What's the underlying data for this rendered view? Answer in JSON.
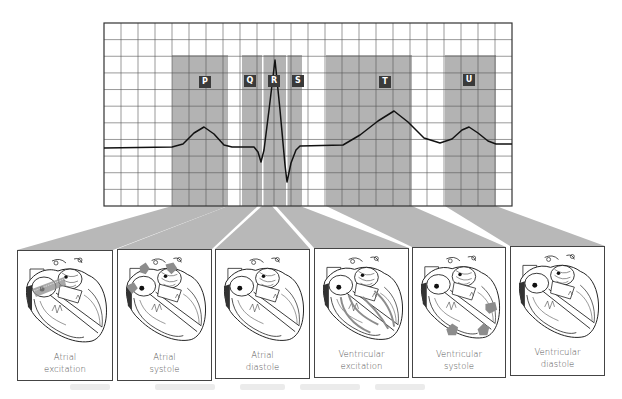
{
  "diagram": {
    "type": "ECG waveform correlated with cardiac cycle phases",
    "colors": {
      "grid_line": "#555555",
      "band_fill": "#b3b3b3",
      "beam_fill": "#b8b8b8",
      "trace": "#111111",
      "label_bg": "#3a3a3a",
      "label_fg": "#ffffff",
      "panel_border": "#444444",
      "highlight": "#8c8c8c"
    },
    "grid": {
      "x": 104,
      "y": 23,
      "width": 408,
      "height": 183,
      "columns": 24,
      "rows": 11
    },
    "waves": [
      {
        "label": "P",
        "band_x": 172,
        "band_w": 56,
        "label_x": 199,
        "label_y": 76
      },
      {
        "label": "Q",
        "band_x": 242,
        "band_w": 20,
        "label_x": 244,
        "label_y": 75
      },
      {
        "label": "R",
        "band_x": 264,
        "band_w": 16,
        "label_x": 268,
        "label_y": 75
      },
      {
        "label": "S",
        "band_x": 282,
        "band_w": 20,
        "label_x": 292,
        "label_y": 75
      },
      {
        "label": "T",
        "band_x": 326,
        "band_w": 86,
        "label_x": 379,
        "label_y": 76
      },
      {
        "label": "U",
        "band_x": 445,
        "band_w": 51,
        "label_x": 463,
        "label_y": 74
      }
    ],
    "panels": [
      {
        "line1": "Atrial",
        "line2": "excitation",
        "x": 17,
        "y": 250,
        "w": 96,
        "h": 131,
        "highlight": "atria-conduction"
      },
      {
        "line1": "Atrial",
        "line2": "systole",
        "x": 117,
        "y": 249,
        "w": 95,
        "h": 132,
        "highlight": "atria-arrows"
      },
      {
        "line1": "Atrial",
        "line2": "diastole",
        "x": 215,
        "y": 249,
        "w": 95,
        "h": 130,
        "highlight": "none"
      },
      {
        "line1": "Ventricular",
        "line2": "excitation",
        "x": 314,
        "y": 248,
        "w": 95,
        "h": 130,
        "highlight": "ventricle-conduction"
      },
      {
        "line1": "Ventricular",
        "line2": "systole",
        "x": 412,
        "y": 247,
        "w": 94,
        "h": 131,
        "highlight": "ventricle-arrows"
      },
      {
        "line1": "Ventricular",
        "line2": "diastole",
        "x": 510,
        "y": 246,
        "w": 95,
        "h": 130,
        "highlight": "none"
      }
    ],
    "trace_points": [
      [
        104,
        148
      ],
      [
        172,
        147
      ],
      [
        183,
        144
      ],
      [
        194,
        133
      ],
      [
        204,
        127
      ],
      [
        214,
        134
      ],
      [
        224,
        145
      ],
      [
        232,
        147
      ],
      [
        254,
        147
      ],
      [
        258,
        152
      ],
      [
        261,
        162
      ],
      [
        264,
        150
      ],
      [
        269,
        110
      ],
      [
        275,
        60
      ],
      [
        280,
        110
      ],
      [
        285,
        165
      ],
      [
        287,
        182
      ],
      [
        291,
        163
      ],
      [
        296,
        150
      ],
      [
        300,
        146
      ],
      [
        343,
        145
      ],
      [
        360,
        135
      ],
      [
        378,
        121
      ],
      [
        394,
        111
      ],
      [
        408,
        122
      ],
      [
        424,
        138
      ],
      [
        440,
        143
      ],
      [
        452,
        139
      ],
      [
        462,
        130
      ],
      [
        469,
        127
      ],
      [
        478,
        133
      ],
      [
        488,
        141
      ],
      [
        496,
        144
      ],
      [
        512,
        144
      ]
    ]
  }
}
